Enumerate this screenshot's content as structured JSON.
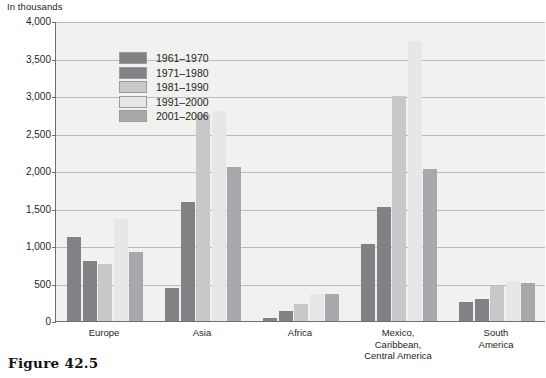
{
  "figure": {
    "caption": "Figure 42.5",
    "unit_label": "In thousands"
  },
  "legend": {
    "items": [
      {
        "label": "1961–1970",
        "color": "#808285"
      },
      {
        "label": "1971–1980",
        "color": "#808285"
      },
      {
        "label": "1981–1990",
        "color": "#c7c8ca"
      },
      {
        "label": "1991–2000",
        "color": "#e6e7e8"
      },
      {
        "label": "2001–2006",
        "color": "#a7a9ac"
      }
    ]
  },
  "axis": {
    "y_ticks": [
      "0",
      "500",
      "1,000",
      "1,500",
      "2,000",
      "2,500",
      "3,000",
      "3,500",
      "4,000"
    ],
    "y_values": [
      0,
      500,
      1000,
      1500,
      2000,
      2500,
      3000,
      3500,
      4000
    ]
  },
  "chart_data": {
    "type": "bar",
    "title": "Figure 42.5",
    "xlabel": "",
    "ylabel": "In thousands",
    "ylim": [
      0,
      4000
    ],
    "ytick_step": 500,
    "grid": true,
    "legend_position": "top-left inside plot",
    "categories": [
      "Europe",
      "Asia",
      "Africa",
      "Mexico,\nCaribbean,\nCentral America",
      "South\nAmerica"
    ],
    "series": [
      {
        "name": "1961–1970",
        "color": "#808285",
        "values": [
          1123,
          445,
          39,
          1032,
          258
        ]
      },
      {
        "name": "1971–1980",
        "color": "#808285",
        "values": [
          800,
          1588,
          127,
          1526,
          296
        ]
      },
      {
        "name": "1981–1990",
        "color": "#c7c8ca",
        "values": [
          762,
          2760,
          229,
          2996,
          461
        ]
      },
      {
        "name": "1991–2000",
        "color": "#e6e7e8",
        "values": [
          1360,
          2795,
          355,
          3740,
          531
        ]
      },
      {
        "name": "2001–2006",
        "color": "#a7a9ac",
        "values": [
          918,
          2060,
          364,
          2030,
          512
        ]
      }
    ]
  }
}
